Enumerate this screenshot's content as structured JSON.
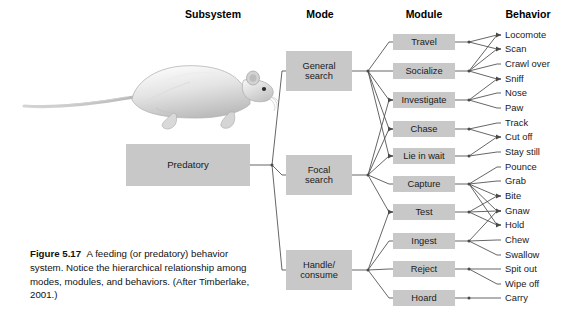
{
  "figure": {
    "caption_label": "Figure 5.17",
    "caption_text": "A feeding (or predatory) behavior system. Notice the hierarchical relationship among modes, modules, and behaviors. (After Timberlake, 2001.)",
    "illustration": "laboratory-rat-illustration",
    "box_fill_color": "#c8c8c8",
    "line_color": "#4a4a4a",
    "text_color": "#1a1a1a",
    "background_color": "#ffffff"
  },
  "columns": [
    {
      "id": "subsystem",
      "label": "Subsystem",
      "x": 213
    },
    {
      "id": "mode",
      "label": "Mode",
      "x": 320
    },
    {
      "id": "module",
      "label": "Module",
      "x": 424
    },
    {
      "id": "behavior",
      "label": "Behavior",
      "x": 528
    }
  ],
  "subsystems": [
    {
      "id": "predatory",
      "label": "Predatory",
      "x": 126,
      "y": 144,
      "w": 124,
      "h": 42
    }
  ],
  "modes": [
    {
      "id": "general-search",
      "label": "General\nsearch",
      "x": 286,
      "y": 51,
      "w": 66,
      "h": 40
    },
    {
      "id": "focal-search",
      "label": "Focal\nsearch",
      "x": 286,
      "y": 155,
      "w": 66,
      "h": 40
    },
    {
      "id": "handle-consume",
      "label": "Handle/\nconsume",
      "x": 286,
      "y": 250,
      "w": 66,
      "h": 40
    }
  ],
  "modules": [
    {
      "id": "travel",
      "label": "Travel",
      "x": 393,
      "y": 34,
      "w": 62,
      "h": 16
    },
    {
      "id": "socialize",
      "label": "Socialize",
      "x": 393,
      "y": 63,
      "w": 62,
      "h": 16
    },
    {
      "id": "investigate",
      "label": "Investigate",
      "x": 393,
      "y": 92,
      "w": 62,
      "h": 16
    },
    {
      "id": "chase",
      "label": "Chase",
      "x": 393,
      "y": 121,
      "w": 62,
      "h": 16
    },
    {
      "id": "lie-in-wait",
      "label": "Lie in wait",
      "x": 393,
      "y": 148,
      "w": 62,
      "h": 16
    },
    {
      "id": "capture",
      "label": "Capture",
      "x": 393,
      "y": 176,
      "w": 62,
      "h": 16
    },
    {
      "id": "test",
      "label": "Test",
      "x": 393,
      "y": 204,
      "w": 62,
      "h": 16
    },
    {
      "id": "ingest",
      "label": "Ingest",
      "x": 393,
      "y": 233,
      "w": 62,
      "h": 16
    },
    {
      "id": "reject",
      "label": "Reject",
      "x": 393,
      "y": 261,
      "w": 62,
      "h": 16
    },
    {
      "id": "hoard",
      "label": "Hoard",
      "x": 393,
      "y": 290,
      "w": 62,
      "h": 16
    }
  ],
  "behaviors": [
    {
      "id": "locomote",
      "label": "Locomote",
      "x": 505,
      "y": 35
    },
    {
      "id": "scan",
      "label": "Scan",
      "x": 505,
      "y": 49
    },
    {
      "id": "crawl-over",
      "label": "Crawl over",
      "x": 505,
      "y": 64
    },
    {
      "id": "sniff",
      "label": "Sniff",
      "x": 505,
      "y": 79
    },
    {
      "id": "nose",
      "label": "Nose",
      "x": 505,
      "y": 93
    },
    {
      "id": "paw",
      "label": "Paw",
      "x": 505,
      "y": 108
    },
    {
      "id": "track",
      "label": "Track",
      "x": 505,
      "y": 123
    },
    {
      "id": "cut-off",
      "label": "Cut off",
      "x": 505,
      "y": 137
    },
    {
      "id": "stay-still",
      "label": "Stay still",
      "x": 505,
      "y": 152
    },
    {
      "id": "pounce",
      "label": "Pounce",
      "x": 505,
      "y": 167
    },
    {
      "id": "grab",
      "label": "Grab",
      "x": 505,
      "y": 181
    },
    {
      "id": "bite",
      "label": "Bite",
      "x": 505,
      "y": 196
    },
    {
      "id": "gnaw",
      "label": "Gnaw",
      "x": 505,
      "y": 211
    },
    {
      "id": "hold",
      "label": "Hold",
      "x": 505,
      "y": 225
    },
    {
      "id": "chew",
      "label": "Chew",
      "x": 505,
      "y": 240
    },
    {
      "id": "swallow",
      "label": "Swallow",
      "x": 505,
      "y": 255
    },
    {
      "id": "spit-out",
      "label": "Spit out",
      "x": 505,
      "y": 269
    },
    {
      "id": "wipe-off",
      "label": "Wipe off",
      "x": 505,
      "y": 284
    },
    {
      "id": "carry",
      "label": "Carry",
      "x": 505,
      "y": 298
    }
  ],
  "edges": {
    "subsystem_to_mode": [
      {
        "from": "predatory",
        "to": "general-search"
      },
      {
        "from": "predatory",
        "to": "focal-search"
      },
      {
        "from": "predatory",
        "to": "handle-consume"
      }
    ],
    "mode_to_module": [
      {
        "from": "general-search",
        "to": "travel"
      },
      {
        "from": "general-search",
        "to": "socialize"
      },
      {
        "from": "general-search",
        "to": "investigate"
      },
      {
        "from": "general-search",
        "to": "chase"
      },
      {
        "from": "general-search",
        "to": "lie-in-wait"
      },
      {
        "from": "focal-search",
        "to": "investigate"
      },
      {
        "from": "focal-search",
        "to": "chase"
      },
      {
        "from": "focal-search",
        "to": "lie-in-wait"
      },
      {
        "from": "focal-search",
        "to": "capture"
      },
      {
        "from": "focal-search",
        "to": "test"
      },
      {
        "from": "handle-consume",
        "to": "test"
      },
      {
        "from": "handle-consume",
        "to": "ingest"
      },
      {
        "from": "handle-consume",
        "to": "reject"
      },
      {
        "from": "handle-consume",
        "to": "hoard"
      }
    ],
    "module_to_behavior": [
      {
        "from": "travel",
        "to": "locomote"
      },
      {
        "from": "travel",
        "to": "scan"
      },
      {
        "from": "socialize",
        "to": "locomote"
      },
      {
        "from": "socialize",
        "to": "scan"
      },
      {
        "from": "socialize",
        "to": "crawl-over"
      },
      {
        "from": "socialize",
        "to": "sniff"
      },
      {
        "from": "investigate",
        "to": "sniff"
      },
      {
        "from": "investigate",
        "to": "nose"
      },
      {
        "from": "investigate",
        "to": "paw"
      },
      {
        "from": "chase",
        "to": "track"
      },
      {
        "from": "chase",
        "to": "cut-off"
      },
      {
        "from": "lie-in-wait",
        "to": "cut-off"
      },
      {
        "from": "lie-in-wait",
        "to": "stay-still"
      },
      {
        "from": "capture",
        "to": "pounce"
      },
      {
        "from": "capture",
        "to": "grab"
      },
      {
        "from": "capture",
        "to": "bite"
      },
      {
        "from": "capture",
        "to": "gnaw"
      },
      {
        "from": "capture",
        "to": "hold"
      },
      {
        "from": "test",
        "to": "bite"
      },
      {
        "from": "test",
        "to": "gnaw"
      },
      {
        "from": "test",
        "to": "hold"
      },
      {
        "from": "ingest",
        "to": "gnaw"
      },
      {
        "from": "ingest",
        "to": "chew"
      },
      {
        "from": "ingest",
        "to": "swallow"
      },
      {
        "from": "reject",
        "to": "spit-out"
      },
      {
        "from": "reject",
        "to": "wipe-off"
      },
      {
        "from": "hoard",
        "to": "carry"
      }
    ]
  }
}
